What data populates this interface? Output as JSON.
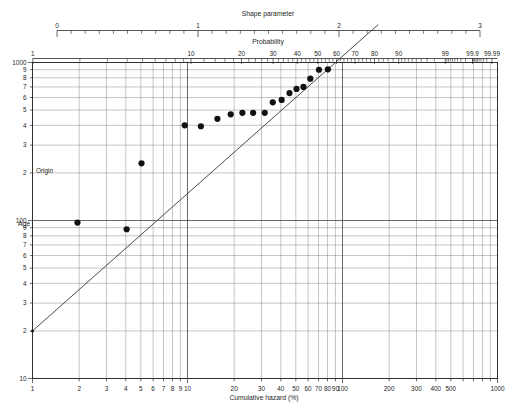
{
  "figure": {
    "top_axis_title": "Shape parameter",
    "probability_axis_title": "Probability",
    "x_axis_title": "Cumulative hazard (%)",
    "y_axis_title": "Age",
    "origin_label": "Origin",
    "background_color": "#ffffff",
    "ink_color": "#1a1a1a",
    "point_color": "#111111",
    "grid_major_color": "#3a3a3a",
    "grid_minor_color": "#7d7d7d"
  },
  "chart_data": {
    "type": "scatter",
    "title": "",
    "subtitle": "",
    "plot_kind": "weibull-hazard-probability-plot",
    "xlabel": "Cumulative hazard (%)",
    "ylabel": "Age",
    "xscale": "log",
    "yscale": "log",
    "xlim": [
      1,
      1000
    ],
    "ylim": [
      10,
      1000
    ],
    "grid": true,
    "legend": null,
    "x_tick_labels": [
      "1",
      "2",
      "3",
      "4",
      "5",
      "6",
      "7",
      "8",
      "9",
      "10",
      "20",
      "30",
      "40",
      "50",
      "60",
      "70",
      "80",
      "90",
      "100",
      "200",
      "300",
      "400",
      "500",
      "1000"
    ],
    "x_tick_values": [
      1,
      2,
      3,
      4,
      5,
      6,
      7,
      8,
      9,
      10,
      20,
      30,
      40,
      50,
      60,
      70,
      80,
      90,
      100,
      200,
      300,
      400,
      500,
      1000
    ],
    "y_tick_labels": [
      "10",
      "2",
      "3",
      "4",
      "5",
      "6",
      "7",
      "8",
      "9",
      "100",
      "2",
      "3",
      "4",
      "5",
      "6",
      "7",
      "8",
      "9",
      "1000"
    ],
    "y_tick_values": [
      10,
      20,
      30,
      40,
      50,
      60,
      70,
      80,
      90,
      100,
      200,
      300,
      400,
      500,
      600,
      700,
      800,
      900,
      1000
    ],
    "top_axis": {
      "title": "Shape parameter",
      "lim": [
        0,
        3
      ],
      "tick_labels": [
        "0",
        "1",
        "2",
        "3"
      ],
      "tick_values": [
        0,
        1,
        2,
        3
      ],
      "minor_step": 0.1
    },
    "probability_axis": {
      "title": "Probability",
      "tick_labels": [
        "1",
        "10",
        "20",
        "30",
        "40",
        "50",
        "60",
        "70",
        "80",
        "90",
        "99",
        "99.9",
        "99.99"
      ],
      "tick_values": [
        1,
        10,
        20,
        30,
        40,
        50,
        60,
        70,
        80,
        90,
        99,
        99.9,
        99.99
      ],
      "scale": "weibull-cumulative-hazard"
    },
    "origin": {
      "label": "Origin",
      "hazard_percent": 1.0,
      "age": 20
    },
    "fit_line": {
      "from": {
        "hazard_percent": 1.0,
        "age": 20
      },
      "to": {
        "hazard_percent": 90,
        "age": 1000
      },
      "shape_parameter": 2.0
    },
    "points": [
      {
        "hazard_percent": 1.95,
        "age": 97
      },
      {
        "hazard_percent": 4.05,
        "age": 88
      },
      {
        "hazard_percent": 5.05,
        "age": 230
      },
      {
        "hazard_percent": 9.6,
        "age": 400
      },
      {
        "hazard_percent": 12.2,
        "age": 395
      },
      {
        "hazard_percent": 15.6,
        "age": 440
      },
      {
        "hazard_percent": 19.0,
        "age": 470
      },
      {
        "hazard_percent": 22.6,
        "age": 480
      },
      {
        "hazard_percent": 26.5,
        "age": 480
      },
      {
        "hazard_percent": 31.5,
        "age": 480
      },
      {
        "hazard_percent": 35.5,
        "age": 560
      },
      {
        "hazard_percent": 40.5,
        "age": 580
      },
      {
        "hazard_percent": 45.5,
        "age": 640
      },
      {
        "hazard_percent": 50.5,
        "age": 680
      },
      {
        "hazard_percent": 56.0,
        "age": 700
      },
      {
        "hazard_percent": 62.0,
        "age": 790
      },
      {
        "hazard_percent": 70.5,
        "age": 900
      },
      {
        "hazard_percent": 80.5,
        "age": 905
      }
    ]
  }
}
